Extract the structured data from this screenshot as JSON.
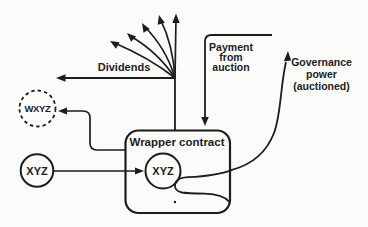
{
  "diagram": {
    "background": "#fbfbfa",
    "ink": "#1d1d1d",
    "nodes": {
      "wrapper": {
        "label": "Wrapper contract",
        "shape": "rounded-rect"
      },
      "inner_token": {
        "label": "XYZ",
        "shape": "circle"
      },
      "outer_token": {
        "label": "XYZ",
        "shape": "circle"
      },
      "wrapped_token": {
        "label": "WXYZ",
        "shape": "dashed-circle"
      }
    },
    "labels": {
      "dividends": "Dividends",
      "payment": [
        "Payment",
        "from",
        "auction"
      ],
      "governance": [
        "Governance",
        "power",
        "(auctioned)"
      ]
    }
  }
}
